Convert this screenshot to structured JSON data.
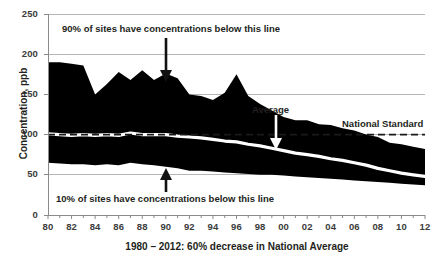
{
  "chart_data": {
    "type": "area",
    "title": "",
    "xlabel": "1980 – 2012: 60% decrease in National Average",
    "ylabel": "Concentration, ppb",
    "ylim": [
      0,
      250
    ],
    "yticks": [
      0,
      50,
      100,
      150,
      200,
      250
    ],
    "ytick_labels": [
      "0",
      "50",
      "100",
      "150",
      "200",
      "250"
    ],
    "grid": true,
    "legend_position": "none",
    "x": [
      1980,
      1981,
      1982,
      1983,
      1984,
      1985,
      1986,
      1987,
      1988,
      1989,
      1990,
      1991,
      1992,
      1993,
      1994,
      1995,
      1996,
      1997,
      1998,
      1999,
      2000,
      2001,
      2002,
      2003,
      2004,
      2005,
      2006,
      2007,
      2008,
      2009,
      2010,
      2011,
      2012
    ],
    "xtick_labels": [
      "80",
      "",
      "82",
      "",
      "84",
      "",
      "86",
      "",
      "88",
      "",
      "90",
      "",
      "92",
      "",
      "94",
      "",
      "96",
      "",
      "98",
      "",
      "00",
      "",
      "02",
      "",
      "04",
      "",
      "06",
      "",
      "08",
      "",
      "10",
      "",
      "12"
    ],
    "series": [
      {
        "name": "90% of sites have concentrations below this line",
        "role": "p90-upper-band",
        "values": [
          190,
          190,
          188,
          186,
          150,
          163,
          178,
          168,
          180,
          168,
          176,
          170,
          150,
          148,
          143,
          152,
          175,
          148,
          138,
          130,
          122,
          118,
          118,
          113,
          112,
          108,
          105,
          100,
          97,
          90,
          88,
          85,
          82
        ]
      },
      {
        "name": "Average",
        "role": "average-line",
        "values": [
          101,
          100,
          99,
          100,
          99,
          100,
          99,
          102,
          100,
          100,
          100,
          98,
          97,
          96,
          94,
          92,
          91,
          88,
          86,
          83,
          80,
          77,
          75,
          73,
          70,
          68,
          65,
          62,
          58,
          55,
          52,
          50,
          48
        ]
      },
      {
        "name": "10% of sites have concentrations below this line",
        "role": "p10-lower-band",
        "values": [
          65,
          64,
          63,
          63,
          62,
          63,
          62,
          65,
          63,
          62,
          60,
          58,
          55,
          55,
          54,
          53,
          52,
          51,
          50,
          50,
          49,
          48,
          47,
          46,
          45,
          44,
          43,
          42,
          41,
          40,
          39,
          38,
          37
        ]
      }
    ],
    "reference_lines": [
      {
        "name": "National Standard",
        "value": 100,
        "style": "dashed",
        "label": "National Standard"
      }
    ],
    "annotations": [
      {
        "id": "p90",
        "text": "90% of sites have concentrations below this line",
        "arrow": "down",
        "points_at_year": 1990
      },
      {
        "id": "p10",
        "text": "10% of sites have concentrations below this line",
        "arrow": "up",
        "points_at_year": 1990
      },
      {
        "id": "average",
        "text": "Average",
        "arrow": "down",
        "points_at_year": 1999
      },
      {
        "id": "national-standard",
        "text": "National Standard",
        "arrow": "none"
      }
    ],
    "colors": {
      "band": "#000000",
      "average_line": "#ffffff",
      "grid": "#b8b8b8",
      "reference_line": "#1a1a1a",
      "text": "#231f20",
      "background": "#ffffff"
    }
  },
  "axis": {
    "y_ticks": [
      "250",
      "200",
      "150",
      "100",
      "50",
      "0"
    ],
    "x_ticks": [
      "80",
      "82",
      "84",
      "86",
      "88",
      "90",
      "92",
      "94",
      "96",
      "98",
      "00",
      "02",
      "04",
      "06",
      "08",
      "10",
      "12"
    ],
    "y_title": "Concentration, ppb",
    "x_title": "1980 – 2012: 60% decrease in National Average"
  },
  "annotations": {
    "p90": "90% of sites have concentrations below this line",
    "p10": "10% of sites have concentrations below this line",
    "average": "Average",
    "national_standard": "National Standard"
  }
}
